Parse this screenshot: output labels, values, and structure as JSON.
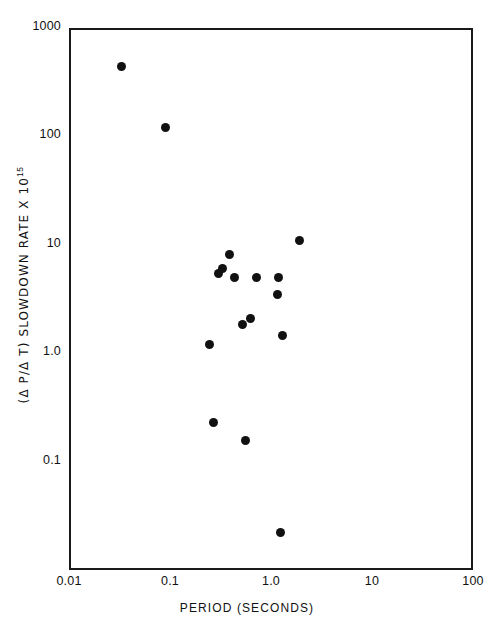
{
  "chart_data": {
    "type": "scatter",
    "title": "",
    "xlabel": "PERIOD (SECONDS)",
    "ylabel": "(Δ P/Δ T) SLOWDOWN RATE X 10",
    "ylabel_exponent": "15",
    "xscale": "log",
    "yscale": "log",
    "xlim": [
      0.01,
      100
    ],
    "ylim": [
      0.01,
      1000
    ],
    "grid": false,
    "legend": null,
    "xticks": [
      {
        "value": 0.01,
        "label": "0.01"
      },
      {
        "value": 0.1,
        "label": "0.1"
      },
      {
        "value": 1.0,
        "label": "1.0"
      },
      {
        "value": 10,
        "label": "10"
      },
      {
        "value": 100,
        "label": "100"
      }
    ],
    "yticks": [
      {
        "value": 1000,
        "label": "1000"
      },
      {
        "value": 100,
        "label": "100"
      },
      {
        "value": 10,
        "label": "10"
      },
      {
        "value": 1.0,
        "label": "1.0"
      },
      {
        "value": 0.1,
        "label": "0.1"
      }
    ],
    "points": [
      {
        "x": 0.033,
        "y": 440
      },
      {
        "x": 0.09,
        "y": 120
      },
      {
        "x": 0.39,
        "y": 8.2
      },
      {
        "x": 0.33,
        "y": 6.1
      },
      {
        "x": 0.3,
        "y": 5.4
      },
      {
        "x": 1.9,
        "y": 11.0
      },
      {
        "x": 0.44,
        "y": 5.0
      },
      {
        "x": 0.72,
        "y": 5.0
      },
      {
        "x": 1.2,
        "y": 5.0
      },
      {
        "x": 1.15,
        "y": 3.5
      },
      {
        "x": 0.62,
        "y": 2.1
      },
      {
        "x": 0.52,
        "y": 1.85
      },
      {
        "x": 1.3,
        "y": 1.45
      },
      {
        "x": 0.245,
        "y": 1.2
      },
      {
        "x": 0.27,
        "y": 0.23
      },
      {
        "x": 0.56,
        "y": 0.155
      },
      {
        "x": 1.25,
        "y": 0.022
      }
    ]
  }
}
